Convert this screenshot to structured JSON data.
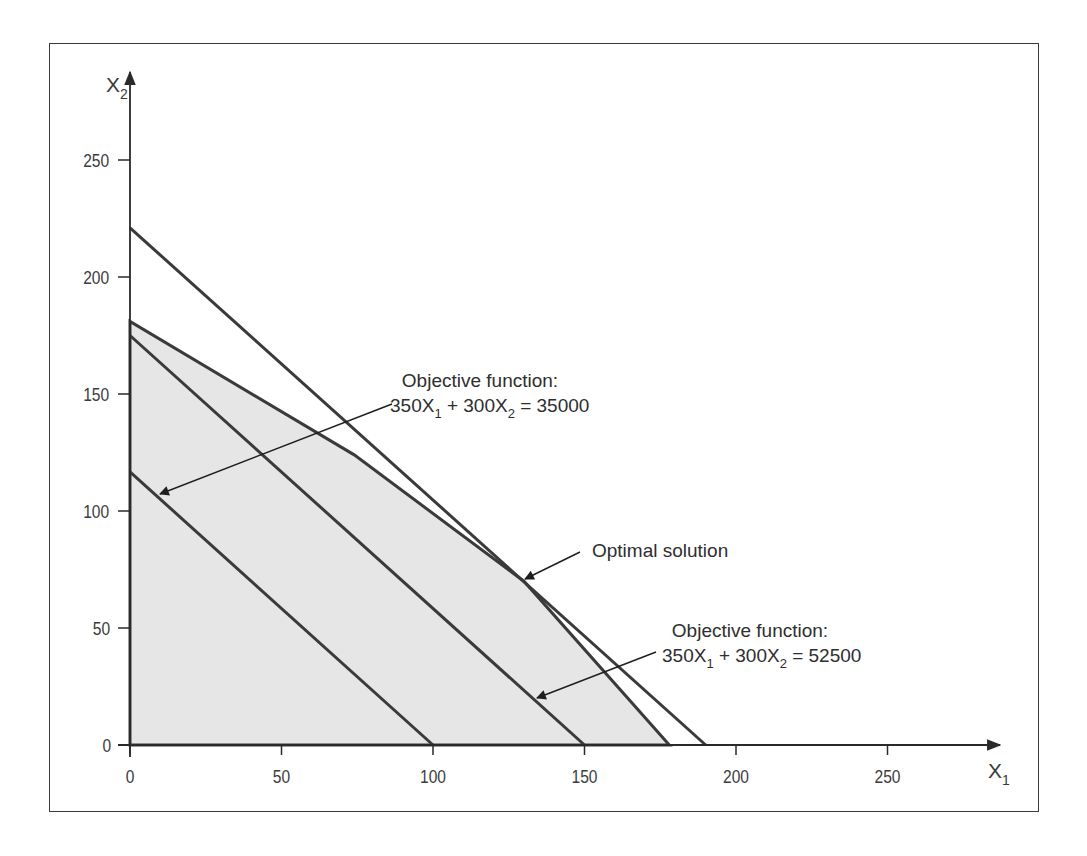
{
  "chart_data": {
    "type": "line",
    "title": "",
    "xlabel": "X1",
    "ylabel": "X2",
    "xlim": [
      0,
      285
    ],
    "ylim": [
      0,
      270
    ],
    "grid": false,
    "legend": "none",
    "x_ticks": [
      0,
      50,
      100,
      150,
      200,
      250
    ],
    "y_ticks": [
      0,
      50,
      100,
      150,
      200,
      250
    ],
    "feasible_region": {
      "name": "Feasible region",
      "fill": "#e6e6e6",
      "vertices": [
        [
          0,
          0
        ],
        [
          0,
          181
        ],
        [
          74,
          124
        ],
        [
          130,
          70
        ],
        [
          178,
          0
        ]
      ]
    },
    "series": [
      {
        "name": "Constraint line",
        "points": [
          [
            0,
            221
          ],
          [
            190,
            0
          ]
        ],
        "color": "#3a3a3a"
      },
      {
        "name": "Objective function: 350X1 + 300X2 = 35000",
        "points": [
          [
            0,
            116.7
          ],
          [
            100,
            0
          ]
        ],
        "color": "#3a3a3a"
      },
      {
        "name": "Objective function: 350X1 + 300X2 = 52500",
        "points": [
          [
            0,
            175
          ],
          [
            150,
            0
          ]
        ],
        "color": "#3a3a3a"
      }
    ],
    "annotations": [
      {
        "id": "obj1",
        "lines": [
          "Objective function:",
          "350X1 + 300X2 = 35000"
        ],
        "arrow_to": [
          10,
          107
        ]
      },
      {
        "id": "optimal",
        "lines": [
          "Optimal solution"
        ],
        "point": [
          130,
          70
        ],
        "arrow_to": [
          130,
          70
        ]
      },
      {
        "id": "obj2",
        "lines": [
          "Objective function:",
          "350X1 + 300X2 = 52500"
        ],
        "arrow_to": [
          134,
          20
        ]
      }
    ]
  },
  "labels": {
    "x_axis": {
      "base": "X",
      "sub": "1"
    },
    "y_axis": {
      "base": "X",
      "sub": "2"
    },
    "obj1_line1": "Objective function:",
    "obj1_eq": {
      "a": "350X",
      "a_sub": "1",
      "b": " + 300X",
      "b_sub": "2",
      "c": " = 35000"
    },
    "optimal": "Optimal solution",
    "obj2_line1": "Objective function:",
    "obj2_eq": {
      "a": "350X",
      "a_sub": "1",
      "b": " + 300X",
      "b_sub": "2",
      "c": " = 52500"
    }
  },
  "ticks": {
    "x": [
      "0",
      "50",
      "100",
      "150",
      "200",
      "250"
    ],
    "y": [
      "0",
      "50",
      "100",
      "150",
      "200",
      "250"
    ]
  }
}
